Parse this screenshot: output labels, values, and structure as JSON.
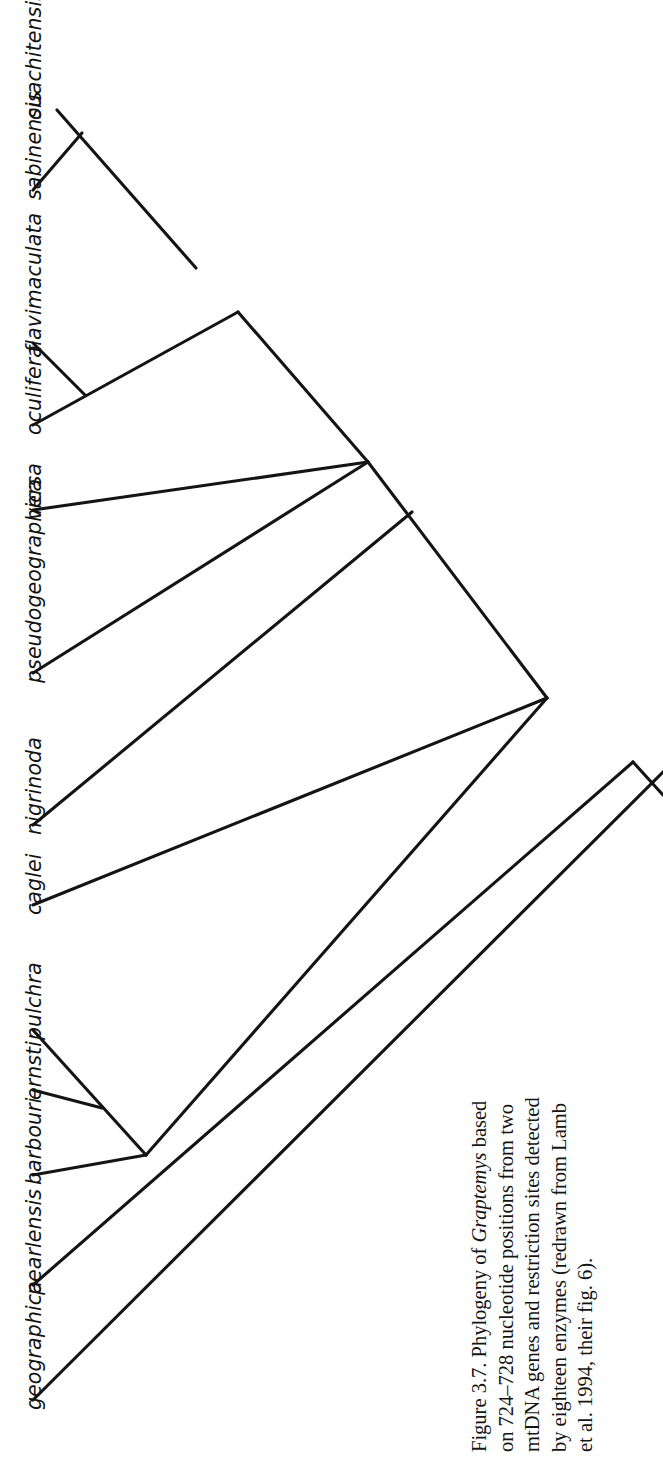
{
  "figure": {
    "label": "Figure 3.7.",
    "caption_lines": [
      "Figure 3.7. Phylogeny of Graptemys based",
      "on 724–728 nucleotide positions from two",
      "mtDNA genes and restriction sites detected",
      "by eighteen enzymes (redrawn from Lamb",
      "et al. 1994, their fig. 6)."
    ],
    "caption_full": "Figure 3.7. Phylogeny of Graptemys based on 724–728 nucleotide positions from two mtDNA genes and restriction sites detected by eighteen enzymes (redrawn from Lamb et al. 1994, their fig. 6).",
    "genus": "Graptemys",
    "line_color": "#141414",
    "background_color": "#ffffff",
    "text_color": "#131313"
  },
  "chart_data": {
    "type": "tree",
    "subtype": "cladogram",
    "title": "Phylogeny of Graptemys",
    "orientation": "rotated-90-tips-left",
    "newick": "(geographica,(pearlensis,(barbouri,(ernsti,pulchra)),(caglei,(nigrinoda,pseudogeographica,versa,(((oculifera,flavimaculata),(sabinensis,ouachitensis))))))));",
    "taxa": [
      {
        "id": "ouachitensis",
        "label": "ouachitensis",
        "order": 1,
        "tip_x": 57,
        "tip_y": 110
      },
      {
        "id": "sabinensis",
        "label": "sabinensis",
        "order": 2,
        "tip_x": 33,
        "tip_y": 190
      },
      {
        "id": "flavimaculata",
        "label": "flavimaculata",
        "order": 3,
        "tip_x": 33,
        "tip_y": 343
      },
      {
        "id": "oculifera",
        "label": "oculifera",
        "order": 4,
        "tip_x": 33,
        "tip_y": 425
      },
      {
        "id": "versa",
        "label": "versa",
        "order": 5,
        "tip_x": 33,
        "tip_y": 510
      },
      {
        "id": "pseudogeographica",
        "label": "pseudogeographica",
        "order": 6,
        "tip_x": 33,
        "tip_y": 673
      },
      {
        "id": "nigrinoda",
        "label": "nigrinoda",
        "order": 7,
        "tip_x": 33,
        "tip_y": 825
      },
      {
        "id": "caglei",
        "label": "caglei",
        "order": 8,
        "tip_x": 33,
        "tip_y": 905
      },
      {
        "id": "pulchra",
        "label": "pulchra",
        "order": 9,
        "tip_x": 33,
        "tip_y": 1030
      },
      {
        "id": "ernsti",
        "label": "ernsti",
        "order": 10,
        "tip_x": 33,
        "tip_y": 1090
      },
      {
        "id": "barbouri",
        "label": "barbouri",
        "order": 11,
        "tip_x": 33,
        "tip_y": 1175
      },
      {
        "id": "pearlensis",
        "label": "pearlensis",
        "order": 12,
        "tip_x": 33,
        "tip_y": 1285
      },
      {
        "id": "geographica",
        "label": "geographica",
        "order": 13,
        "tip_x": 33,
        "tip_y": 1400
      }
    ],
    "nodes": [
      {
        "id": "n_ouach_sabin",
        "x": 82,
        "y": 133,
        "children": [
          "ouachitensis",
          "sabinensis"
        ]
      },
      {
        "id": "n_flavi_oculi",
        "x": 85,
        "y": 395,
        "children": [
          "flavimaculata",
          "oculifera"
        ]
      },
      {
        "id": "n_upper_clade",
        "x": 196,
        "y": 268,
        "children": [
          "n_ouach_sabin",
          "n_flavi_oculi"
        ]
      },
      {
        "id": "n_polytomy",
        "x": 368,
        "y": 462,
        "children": [
          "n_upper_clade",
          "versa",
          "pseudogeographica",
          "nigrinoda"
        ]
      },
      {
        "id": "n_caglei",
        "x": 412,
        "y": 512,
        "children": [
          "n_polytomy",
          "caglei"
        ]
      },
      {
        "id": "n_pulchra_ernsti",
        "x": 102,
        "y": 1108,
        "children": [
          "pulchra",
          "ernsti"
        ]
      },
      {
        "id": "n_barbouri",
        "x": 146,
        "y": 1155,
        "children": [
          "n_pulchra_ernsti",
          "barbouri"
        ]
      },
      {
        "id": "n_pearlensis",
        "x": 547,
        "y": 698,
        "children": [
          "n_barbouri",
          "n_caglei"
        ]
      },
      {
        "id": "n_root",
        "x": 633,
        "y": 762,
        "children": [
          "n_pearlensis",
          "geographica"
        ]
      }
    ],
    "segments": [
      {
        "name": "ouachitensis-branch",
        "x1": 57,
        "y1": 110,
        "x2": 196,
        "y2": 268
      },
      {
        "name": "sabinensis-branch",
        "x1": 33,
        "y1": 190,
        "x2": 82,
        "y2": 133
      },
      {
        "name": "flavimaculata-branch",
        "x1": 33,
        "y1": 343,
        "x2": 85,
        "y2": 395
      },
      {
        "name": "oculifera-branch",
        "x1": 33,
        "y1": 425,
        "x2": 238,
        "y2": 312
      },
      {
        "name": "upper-internal-link",
        "x1": 238,
        "y1": 312,
        "x2": 368,
        "y2": 462
      },
      {
        "name": "versa-branch",
        "x1": 33,
        "y1": 510,
        "x2": 368,
        "y2": 462
      },
      {
        "name": "pseudogeographica-branch",
        "x1": 33,
        "y1": 673,
        "x2": 368,
        "y2": 462
      },
      {
        "name": "nigrinoda-branch",
        "x1": 33,
        "y1": 825,
        "x2": 412,
        "y2": 512
      },
      {
        "name": "polytomy-stem",
        "x1": 368,
        "y1": 462,
        "x2": 547,
        "y2": 698
      },
      {
        "name": "caglei-branch",
        "x1": 33,
        "y1": 905,
        "x2": 547,
        "y2": 698
      },
      {
        "name": "pulchra-branch",
        "x1": 33,
        "y1": 1030,
        "x2": 146,
        "y2": 1155
      },
      {
        "name": "ernsti-branch",
        "x1": 33,
        "y1": 1090,
        "x2": 102,
        "y2": 1108
      },
      {
        "name": "barbouri-branch",
        "x1": 33,
        "y1": 1175,
        "x2": 146,
        "y2": 1155
      },
      {
        "name": "barbouri-clade-stem",
        "x1": 146,
        "y1": 1155,
        "x2": 547,
        "y2": 698
      },
      {
        "name": "pearlensis-branch",
        "x1": 33,
        "y1": 1285,
        "x2": 633,
        "y2": 762
      },
      {
        "name": "root-stem",
        "x1": 633,
        "y1": 762,
        "x2": 663,
        "y2": 795
      },
      {
        "name": "geographica-branch",
        "x1": 33,
        "y1": 1400,
        "x2": 663,
        "y2": 772
      }
    ],
    "n_taxa": 13,
    "grid": false,
    "legend": null,
    "xlabel": "",
    "ylabel": ""
  }
}
